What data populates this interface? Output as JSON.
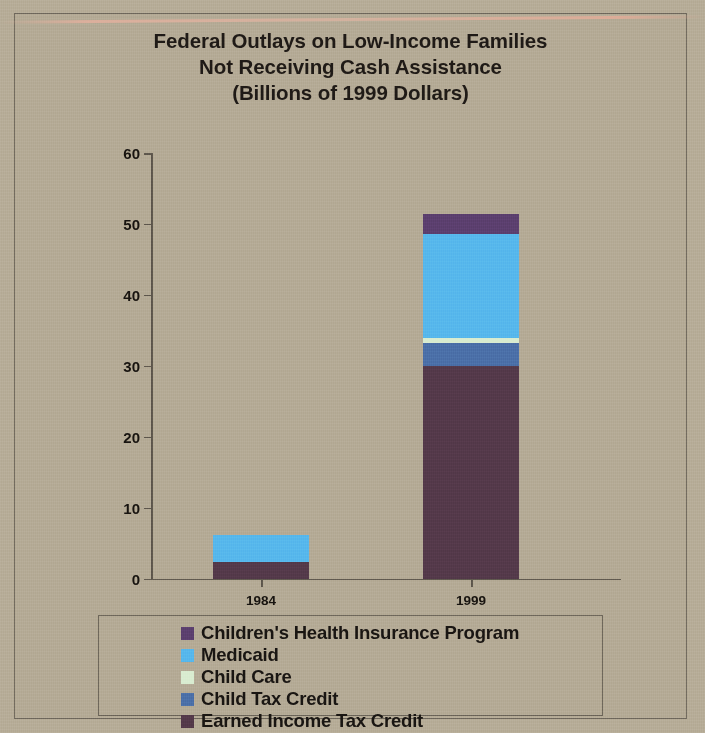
{
  "chart_data": {
    "type": "bar",
    "subtype": "stacked-bar",
    "title": "Federal Outlays on Low-Income Families Not Receiving Cash Assistance (Billions of 1999 Dollars)",
    "title_lines": [
      "Federal Outlays on Low-Income Families",
      "Not Receiving Cash Assistance",
      "(Billions of 1999 Dollars)"
    ],
    "xlabel": "",
    "ylabel": "",
    "categories": [
      "1984",
      "1999"
    ],
    "ylim": [
      0,
      60
    ],
    "yticks": [
      0,
      10,
      20,
      30,
      40,
      50,
      60
    ],
    "ytick_labels": [
      "0",
      "10",
      "20",
      "30",
      "40",
      "50",
      "60"
    ],
    "grid": false,
    "legend_position": "bottom",
    "stack_order_bottom_to_top": [
      "Earned Income Tax Credit",
      "Child Tax Credit",
      "Child Care",
      "Medicaid",
      "Children's Health Insurance Program"
    ],
    "series": [
      {
        "name": "Children's Health Insurance Program",
        "color": "#5b3f6e",
        "values": [
          0.0,
          2.8
        ]
      },
      {
        "name": "Medicaid",
        "color": "#56b7ec",
        "values": [
          3.8,
          14.7
        ]
      },
      {
        "name": "Child Care",
        "color": "#d9ecd0",
        "values": [
          0.0,
          0.7
        ]
      },
      {
        "name": "Child Tax Credit",
        "color": "#4b6fa8",
        "values": [
          0.0,
          3.2
        ]
      },
      {
        "name": "Earned Income Tax Credit",
        "color": "#54394a",
        "values": [
          2.3,
          30.0
        ]
      }
    ],
    "totals": [
      6.1,
      51.4
    ]
  },
  "legend": {
    "items": [
      {
        "label": "Children's Health Insurance Program",
        "color": "#5b3f6e"
      },
      {
        "label": "Medicaid",
        "color": "#56b7ec"
      },
      {
        "label": "Child Care",
        "color": "#d9ecd0"
      },
      {
        "label": "Child Tax Credit",
        "color": "#4b6fa8"
      },
      {
        "label": "Earned Income Tax Credit",
        "color": "#54394a"
      }
    ]
  },
  "colors": {
    "page_background": "#b6ac97",
    "frame_border": "#6f685c",
    "axis": "#5d564c",
    "text": "#17130f"
  }
}
